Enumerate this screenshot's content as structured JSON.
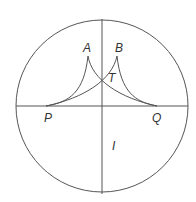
{
  "diagram": {
    "type": "geometric-figure",
    "labels": {
      "A": "A",
      "B": "B",
      "T": "T",
      "P": "P",
      "Q": "Q",
      "I": "I"
    },
    "colors": {
      "stroke": "#555555",
      "text": "#333333",
      "background": "#ffffff"
    }
  }
}
